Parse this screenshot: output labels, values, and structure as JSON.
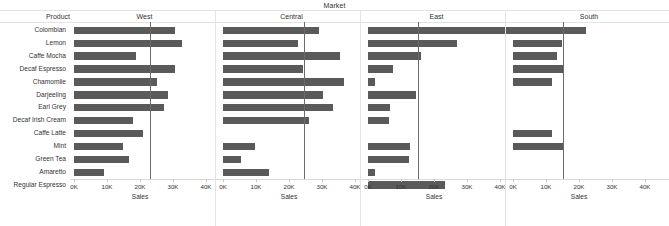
{
  "title": "Market",
  "product_header": "Product",
  "products": [
    "Colombian",
    "Lemon",
    "Caffe Mocha",
    "Decaf Espresso",
    "Chamomile",
    "Darjeeling",
    "Earl Grey",
    "Decaf Irish Cream",
    "Caffe Latte",
    "Mint",
    "Green Tea",
    "Amaretto",
    "Regular Espresso"
  ],
  "axis": {
    "label": "Sales",
    "ticks": [
      "0K",
      "10K",
      "20K",
      "30K",
      "40K"
    ],
    "tick_values": [
      0,
      10000,
      20000,
      30000,
      40000
    ],
    "min": 0,
    "max": 47000
  },
  "colors": {
    "bar": "#5a5a5a",
    "reference_line": "#6b6b6b",
    "grid": "#e3e3e3",
    "text": "#333333"
  },
  "chart_data": {
    "type": "bar",
    "title": "Market",
    "xlabel": "Sales",
    "ylabel": "Product",
    "orientation": "horizontal",
    "grid": false,
    "legend": "none",
    "xlim": [
      0,
      47000
    ],
    "categories": [
      "Colombian",
      "Lemon",
      "Caffe Mocha",
      "Decaf Espresso",
      "Chamomile",
      "Darjeeling",
      "Earl Grey",
      "Decaf Irish Cream",
      "Caffe Latte",
      "Mint",
      "Green Tea",
      "Amaretto",
      "Regular Espresso"
    ],
    "panels": [
      {
        "name": "West",
        "reference_line": 23000,
        "values": [
          30600,
          32700,
          18800,
          30700,
          25300,
          28500,
          27200,
          18000,
          21000,
          14800,
          16600,
          9000,
          null
        ]
      },
      {
        "name": "Central",
        "reference_line": 24500,
        "values": [
          29200,
          22700,
          35400,
          24200,
          36800,
          30300,
          33300,
          26100,
          null,
          9700,
          5600,
          14000,
          null
        ]
      },
      {
        "name": "East",
        "reference_line": 15200,
        "values": [
          46500,
          27000,
          16200,
          7600,
          2100,
          14600,
          6700,
          6300,
          null,
          12700,
          12300,
          2200,
          23300
        ]
      },
      {
        "name": "South",
        "reference_line": 15000,
        "values": [
          22000,
          14700,
          13400,
          15300,
          11800,
          null,
          null,
          null,
          11700,
          15100,
          null,
          null,
          null
        ]
      }
    ]
  }
}
